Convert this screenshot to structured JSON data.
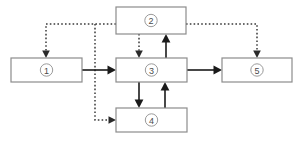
{
  "diagram": {
    "canvas": {
      "width": 302,
      "height": 142,
      "background": "#ffffff"
    },
    "colors": {
      "box_border": "#8c8c8c",
      "box_fill": "#ffffff",
      "circle_border": "#9a9a9a",
      "label_text": "#4a4a4a",
      "solid_edge": "#1a1a1a",
      "dotted_edge": "#3a3a3a"
    },
    "nodes": [
      {
        "id": "node-1",
        "label": "①",
        "number": "1",
        "x": 11,
        "y": 58,
        "w": 71,
        "h": 24
      },
      {
        "id": "node-2",
        "label": "②",
        "number": "2",
        "x": 116,
        "y": 7,
        "w": 70,
        "h": 27
      },
      {
        "id": "node-3",
        "label": "③",
        "number": "3",
        "x": 116,
        "y": 58,
        "w": 71,
        "h": 24
      },
      {
        "id": "node-4",
        "label": "④",
        "number": "4",
        "x": 116,
        "y": 108,
        "w": 71,
        "h": 24
      },
      {
        "id": "node-5",
        "label": "⑤",
        "number": "5",
        "x": 222,
        "y": 58,
        "w": 70,
        "h": 24
      }
    ],
    "edges": [
      {
        "id": "edge-1-3",
        "from": "1",
        "to": "3",
        "style": "solid",
        "direction": "right"
      },
      {
        "id": "edge-3-5",
        "from": "3",
        "to": "5",
        "style": "solid",
        "direction": "right"
      },
      {
        "id": "edge-3-2",
        "from": "3",
        "to": "2",
        "style": "solid",
        "direction": "up"
      },
      {
        "id": "edge-3-4",
        "from": "3",
        "to": "4",
        "style": "solid",
        "direction": "down"
      },
      {
        "id": "edge-4-3",
        "from": "4",
        "to": "3",
        "style": "solid",
        "direction": "up"
      },
      {
        "id": "edge-2-3",
        "from": "2",
        "to": "3",
        "style": "dotted",
        "direction": "down"
      },
      {
        "id": "edge-2-1",
        "from": "2",
        "to": "1",
        "style": "dotted",
        "direction": "down"
      },
      {
        "id": "edge-2-4",
        "from": "2",
        "to": "4",
        "style": "dotted",
        "direction": "right"
      },
      {
        "id": "edge-2-5",
        "from": "2",
        "to": "5",
        "style": "dotted",
        "direction": "down"
      }
    ]
  }
}
